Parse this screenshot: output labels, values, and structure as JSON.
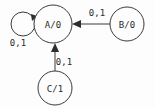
{
  "diagram": {
    "type": "finite-state-machine",
    "title": "",
    "colors": {
      "background": "#fdfdfd",
      "stroke": "#3a3a3a",
      "text": "#2a2a2a"
    },
    "states": [
      {
        "id": "A",
        "label": "A/0",
        "output": "0",
        "cx": 53,
        "cy": 24,
        "r": 19
      },
      {
        "id": "B",
        "label": "B/0",
        "output": "0",
        "cx": 127,
        "cy": 24,
        "r": 17
      },
      {
        "id": "C",
        "label": "C/1",
        "output": "1",
        "cx": 55,
        "cy": 88,
        "r": 17
      }
    ],
    "transitions": [
      {
        "id": "A-self",
        "from": "A",
        "to": "A",
        "label": "0,1",
        "label_x": 18,
        "label_y": 46,
        "kind": "self-loop"
      },
      {
        "id": "B-to-A",
        "from": "B",
        "to": "A",
        "label": "0,1",
        "label_x": 97,
        "label_y": 16,
        "kind": "straight"
      },
      {
        "id": "C-to-A",
        "from": "C",
        "to": "A",
        "label": "0,1",
        "label_x": 64,
        "label_y": 65,
        "kind": "straight"
      }
    ]
  }
}
